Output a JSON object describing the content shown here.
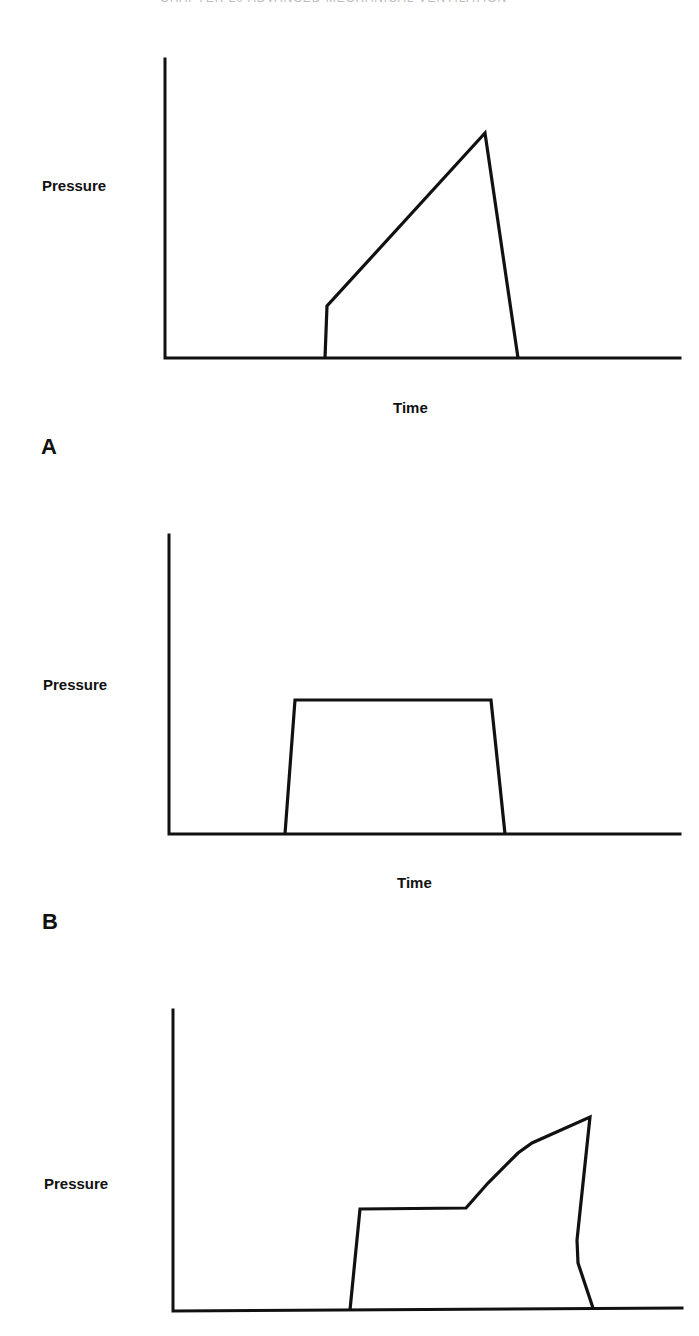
{
  "header": {
    "running_text": "CHAPTER 20   ADVANCED  MECHANICAL  VENTILATION"
  },
  "chart_data": [
    {
      "panel": "A",
      "type": "line",
      "title": "",
      "xlabel": "Time",
      "ylabel": "Pressure",
      "grid": false,
      "description": "Pressure-time waveform: step rise then linear ramp to peak, then rapid fall",
      "axes_px": {
        "origin": [
          165,
          358
        ],
        "y_top": 59,
        "x_end": 680
      },
      "points_px": [
        [
          325,
          358
        ],
        [
          327,
          306
        ],
        [
          485,
          133
        ],
        [
          518,
          358
        ]
      ]
    },
    {
      "panel": "B",
      "type": "line",
      "title": "",
      "xlabel": "Time",
      "ylabel": "Pressure",
      "grid": false,
      "description": "Pressure-time waveform: square/plateau (trapezoidal) pressure",
      "axes_px": {
        "origin": [
          169,
          834
        ],
        "y_top": 535,
        "x_end": 680
      },
      "points_px": [
        [
          285,
          834
        ],
        [
          295,
          700
        ],
        [
          491,
          700
        ],
        [
          505,
          834
        ]
      ]
    },
    {
      "panel": "C",
      "type": "line",
      "title": "",
      "xlabel": "",
      "ylabel": "Pressure",
      "grid": false,
      "description": "Pressure-time waveform: plateau followed by rising pressure to peak, then fall with shoulder",
      "axes_px": {
        "origin": [
          173,
          1311
        ],
        "y_top": 1010,
        "x_end": 682
      },
      "points_px": [
        [
          350,
          1310
        ],
        [
          360,
          1209
        ],
        [
          466,
          1208
        ],
        [
          488,
          1183
        ],
        [
          518,
          1153
        ],
        [
          532,
          1143
        ],
        [
          590,
          1117
        ],
        [
          577,
          1240
        ],
        [
          578,
          1263
        ],
        [
          593,
          1308
        ]
      ]
    }
  ],
  "labels": {
    "a": {
      "ylabel": "Pressure",
      "xlabel": "Time",
      "letter": "A"
    },
    "b": {
      "ylabel": "Pressure",
      "xlabel": "Time",
      "letter": "B"
    },
    "c": {
      "ylabel": "Pressure"
    }
  }
}
